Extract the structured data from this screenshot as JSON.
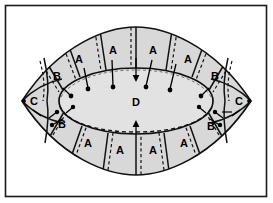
{
  "figure": {
    "frame": {
      "border_color": "#1a1a1a",
      "background_color": "#ffffff",
      "x": 5,
      "y": 5,
      "width": 263,
      "height": 193
    },
    "colors": {
      "outline": "#111111",
      "segment_fill": "#d8d8d8",
      "core_fill": "#e2e2e2",
      "dashed_line": "#111111",
      "leader_line": "#000000",
      "label_text": "#000000"
    },
    "regions": [
      {
        "id": "core",
        "label": "D",
        "x": 136,
        "y": 102,
        "description": "central inner ellipse"
      },
      {
        "id": "top-a-1",
        "label": "A",
        "x": 79,
        "y": 63
      },
      {
        "id": "top-a-2",
        "label": "A",
        "x": 113,
        "y": 54
      },
      {
        "id": "top-a-3",
        "label": "A",
        "x": 153,
        "y": 54
      },
      {
        "id": "top-a-4",
        "label": "A",
        "x": 188,
        "y": 63
      },
      {
        "id": "bottom-a-1",
        "label": "A",
        "x": 88,
        "y": 143
      },
      {
        "id": "bottom-a-2",
        "label": "A",
        "x": 120,
        "y": 150
      },
      {
        "id": "bottom-a-3",
        "label": "A",
        "x": 153,
        "y": 150
      },
      {
        "id": "bottom-a-4",
        "label": "A",
        "x": 184,
        "y": 143
      },
      {
        "id": "top-left-b",
        "label": "B",
        "x": 57,
        "y": 76
      },
      {
        "id": "top-right-b",
        "label": "B",
        "x": 215,
        "y": 76
      },
      {
        "id": "bottom-left-b",
        "label": "B",
        "x": 60,
        "y": 124
      },
      {
        "id": "bottom-right-b",
        "label": "B",
        "x": 211,
        "y": 126
      },
      {
        "id": "left-c",
        "label": "C",
        "x": 32,
        "y": 100
      },
      {
        "id": "right-c",
        "label": "C",
        "x": 239,
        "y": 100
      }
    ],
    "label_legend": [
      {
        "key": "A",
        "meaning": "outer radial segment"
      },
      {
        "key": "B",
        "meaning": "shoulder segment"
      },
      {
        "key": "C",
        "meaning": "tip segment"
      },
      {
        "key": "D",
        "meaning": "central core region"
      }
    ],
    "annotations": {
      "leader_dot_count": 14,
      "arrow_count": 2,
      "dashed_pairs": 12
    }
  }
}
